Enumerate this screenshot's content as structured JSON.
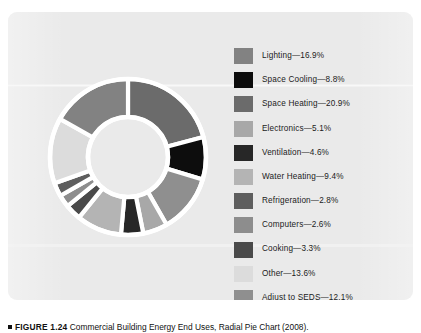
{
  "figure": {
    "label": "FIGURE 1.24",
    "caption_text": "Commercial Building Energy End Uses, Radial Pie Chart (2008).",
    "marker_icon": "square-bullet-icon"
  },
  "panel": {
    "background_color": "#eaeaea",
    "separator_color": "#ffffff"
  },
  "legend": {
    "separator": "—",
    "items": [
      {
        "label": "Lighting",
        "value": "16.9%",
        "text": "Lighting—16.9%",
        "color": "#828282"
      },
      {
        "label": "Space Cooling",
        "value": "8.8%",
        "text": "Space Cooling—8.8%",
        "color": "#0d0d0d"
      },
      {
        "label": "Space Heating",
        "value": "20.9%",
        "text": "Space Heating—20.9%",
        "color": "#6b6b6b"
      },
      {
        "label": "Electronics",
        "value": "5.1%",
        "text": "Electronics—5.1%",
        "color": "#a8a8a8"
      },
      {
        "label": "Ventilation",
        "value": "4.6%",
        "text": "Ventilation—4.6%",
        "color": "#272727"
      },
      {
        "label": "Water Heating",
        "value": "9.4%",
        "text": "Water Heating—9.4%",
        "color": "#b4b4b4"
      },
      {
        "label": "Refrigeration",
        "value": "2.8%",
        "text": "Refrigeration—2.8%",
        "color": "#5e5e5e"
      },
      {
        "label": "Computers",
        "value": "2.6%",
        "text": "Computers—2.6%",
        "color": "#8d8d8d"
      },
      {
        "label": "Cooking",
        "value": "3.3%",
        "text": "Cooking—3.3%",
        "color": "#4a4a4a"
      },
      {
        "label": "Other",
        "value": "13.6%",
        "text": "Other—13.6%",
        "color": "#dcdcdc"
      },
      {
        "label": "Adjust to SEDS",
        "value": "12.1%",
        "text": "Adjust to SEDS—12.1%",
        "color": "#8f8f8f"
      }
    ]
  },
  "chart_data": {
    "type": "pie",
    "variant": "donut",
    "title": "Commercial Building Energy End Uses, Radial Pie Chart (2008)",
    "units": "percent",
    "start_angle_deg": 0,
    "direction": "clockwise",
    "inner_radius_ratio": 0.51,
    "legend_position": "right",
    "grid": false,
    "total": "100.1%",
    "categories": [
      "Lighting",
      "Space Cooling",
      "Space Heating",
      "Electronics",
      "Ventilation",
      "Water Heating",
      "Refrigeration",
      "Computers",
      "Cooking",
      "Other",
      "Adjust to SEDS"
    ],
    "values": [
      16.9,
      8.8,
      20.9,
      5.1,
      4.6,
      9.4,
      2.8,
      2.6,
      3.3,
      13.6,
      12.1
    ],
    "slice_order_clockwise_from_top": [
      {
        "name": "Space Heating",
        "value": 20.9,
        "color": "#6b6b6b"
      },
      {
        "name": "Space Cooling",
        "value": 8.8,
        "color": "#0d0d0d"
      },
      {
        "name": "Adjust to SEDS",
        "value": 12.1,
        "color": "#8f8f8f"
      },
      {
        "name": "Electronics",
        "value": 5.1,
        "color": "#a8a8a8"
      },
      {
        "name": "Ventilation",
        "value": 4.6,
        "color": "#272727"
      },
      {
        "name": "Water Heating",
        "value": 9.4,
        "color": "#b4b4b4"
      },
      {
        "name": "Cooking",
        "value": 3.3,
        "color": "#4a4a4a"
      },
      {
        "name": "Computers",
        "value": 2.6,
        "color": "#8d8d8d"
      },
      {
        "name": "Refrigeration",
        "value": 2.8,
        "color": "#5e5e5e"
      },
      {
        "name": "Other",
        "value": 13.6,
        "color": "#dcdcdc"
      },
      {
        "name": "Lighting",
        "value": 16.9,
        "color": "#828282"
      }
    ]
  }
}
